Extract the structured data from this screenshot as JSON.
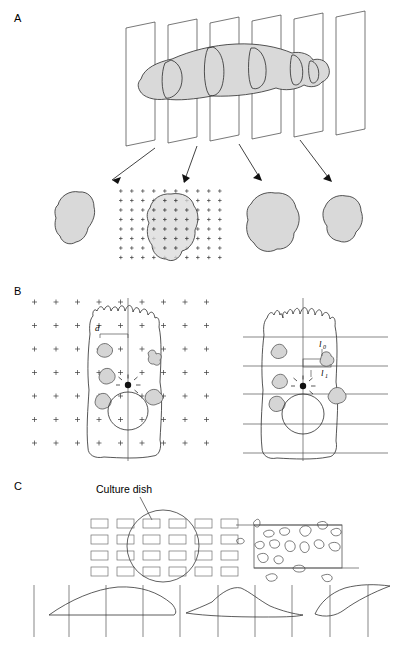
{
  "figure": {
    "width": 395,
    "height": 647,
    "background": "#ffffff"
  },
  "panels": [
    {
      "id": "A",
      "letter": "A",
      "letter_x": 14,
      "letter_y": 22,
      "description": "Three dimensional object cut by a series of parallel section planes, with four resulting profiles shown below; the second profile is overlaid with a point counting grid of plus marks.",
      "section_planes": 6,
      "arrows": 4,
      "profiles_below": 4,
      "grid_profile_index": 1,
      "point_grid": {
        "columns": 10,
        "rows": 8,
        "spacing_x": 11,
        "spacing_y": 9.5,
        "glyph": "plus-mark"
      }
    },
    {
      "id": "B",
      "letter": "B",
      "letter_x": 14,
      "letter_y": 295,
      "description": "Two drawings of the same cell profile. Left cell is overlaid with a square lattice of test points and a vertical test line; right cell is overlaid with a set of horizontal test lines and a vertical line.",
      "left_cell": {
        "labels": [
          {
            "text": "d",
            "subscript": "",
            "x": 95,
            "y": 331
          }
        ],
        "point_grid": {
          "columns": 9,
          "rows": 7,
          "spacing_x": 21.5,
          "spacing_y": 23.5,
          "glyph": "plus-mark"
        },
        "vertical_test_lines": 1,
        "gold_particle": true,
        "organelles": 5,
        "nucleus": true
      },
      "right_cell": {
        "labels": [
          {
            "text": "l",
            "subscript": "0",
            "x": 324,
            "y": 345
          },
          {
            "text": "l",
            "subscript": "1",
            "x": 326,
            "y": 374
          }
        ],
        "horizontal_test_lines": 5,
        "vertical_test_lines": 1,
        "gold_particle": true,
        "organelles": 4,
        "nucleus": true
      }
    },
    {
      "id": "C",
      "letter": "C",
      "letter_x": 14,
      "letter_y": 490,
      "description": "Culture dish sampling scheme: an array of rectangular blocks overlaid by a circle marking the culture dish, a magnified tissue block containing cell profiles with horizontal test lines, and a bottom row of lens shaped section profiles crossed by vertical test lines.",
      "callout_label": "Culture dish",
      "callout_label_x": 96,
      "callout_label_y": 493,
      "block_array": {
        "columns": 6,
        "rows": 4
      },
      "tissue_block": {
        "cell_profiles": 18,
        "horizontal_test_lines": 2
      },
      "bottom_profiles": 3,
      "bottom_vertical_lines": 9
    }
  ],
  "colors": {
    "organ_fill": "#d9d9d9",
    "organelle_fill": "#d5d5d5",
    "ink": "#2b2b2b",
    "grid": "#555555",
    "background": "#ffffff"
  }
}
